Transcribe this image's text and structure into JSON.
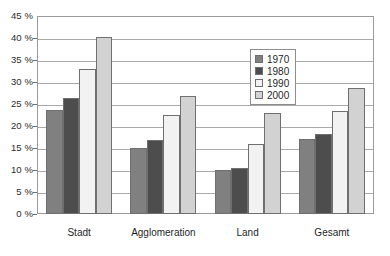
{
  "chart_data": {
    "type": "bar",
    "title": "",
    "subtitle": "",
    "xlabel": "",
    "ylabel": "",
    "categories": [
      "Stadt",
      "Agglomeration",
      "Land",
      "Gesamt"
    ],
    "series": [
      {
        "name": "1970",
        "color": "#808080",
        "values": [
          23.7,
          15.0,
          10.0,
          17.0
        ]
      },
      {
        "name": "1980",
        "color": "#4d4d4d",
        "values": [
          26.4,
          16.8,
          10.5,
          18.2
        ]
      },
      {
        "name": "1990",
        "color": "#f2f2f2",
        "values": [
          33.0,
          22.5,
          16.0,
          23.3
        ]
      },
      {
        "name": "2000",
        "color": "#d2d2d2",
        "values": [
          40.3,
          26.8,
          23.0,
          28.7
        ]
      }
    ],
    "ylim": [
      0,
      45
    ],
    "ytick_step": 5,
    "ytick_labels": [
      "0 %",
      "5 %",
      "10 %",
      "15 %",
      "20 %",
      "25 %",
      "30 %",
      "35 %",
      "40 %",
      "45 %"
    ],
    "ytick_values": [
      0,
      5,
      10,
      15,
      20,
      25,
      30,
      35,
      40,
      45
    ],
    "grid": true,
    "grid_axis": "y",
    "legend_position": "inside-top-center",
    "legend_entries": [
      "1970",
      "1980",
      "1990",
      "2000"
    ],
    "plot_border_color": "#9a9a9a",
    "gridline_color": "#a9a9a9",
    "bar_outline_color": "#6f6f6f",
    "background_color": "#ffffff"
  }
}
